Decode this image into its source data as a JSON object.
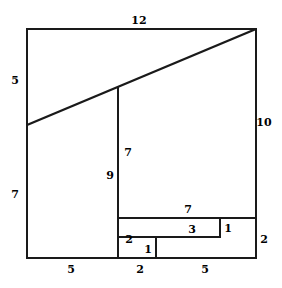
{
  "figure": {
    "stroke_color": "#1a1a1a",
    "background_color": "#ffffff",
    "outer_square": {
      "top_length": "12",
      "right_length": "10",
      "left_upper_length": "5",
      "left_lower_length": "7"
    },
    "labels": [
      {
        "id": "top-12",
        "text": "12",
        "x": 139,
        "y": 20
      },
      {
        "id": "left-5",
        "text": "5",
        "x": 15,
        "y": 80
      },
      {
        "id": "left-7",
        "text": "7",
        "x": 15,
        "y": 194
      },
      {
        "id": "right-10",
        "text": "10",
        "x": 264,
        "y": 122
      },
      {
        "id": "right-2",
        "text": "2",
        "x": 264,
        "y": 239
      },
      {
        "id": "inner-7",
        "text": "7",
        "x": 128,
        "y": 152
      },
      {
        "id": "inner-9",
        "text": "9",
        "x": 110,
        "y": 175
      },
      {
        "id": "band-7",
        "text": "7",
        "x": 188,
        "y": 209
      },
      {
        "id": "band-3",
        "text": "3",
        "x": 192,
        "y": 229
      },
      {
        "id": "band-1-right",
        "text": "1",
        "x": 228,
        "y": 228
      },
      {
        "id": "band-2-left",
        "text": "2",
        "x": 129,
        "y": 239
      },
      {
        "id": "band-1-bottom",
        "text": "1",
        "x": 148,
        "y": 249
      },
      {
        "id": "bottom-5-left",
        "text": "5",
        "x": 71,
        "y": 269
      },
      {
        "id": "bottom-2",
        "text": "2",
        "x": 140,
        "y": 269
      },
      {
        "id": "bottom-5-right",
        "text": "5",
        "x": 205,
        "y": 269
      }
    ],
    "geometry": {
      "outer_rect": {
        "x": 27,
        "y": 29,
        "w": 229,
        "h": 229
      },
      "diagonal": {
        "x1": 27,
        "y1": 125,
        "x2": 256,
        "y2": 29
      },
      "vertical_divider": {
        "x": 118,
        "y1": 86,
        "y2": 258
      },
      "band_top": {
        "y": 218,
        "x1": 118,
        "x2": 256
      },
      "step_path": "M 118 237 L 156 237 L 156 258",
      "step_path2": "M 156 237 L 220 237 L 220 218"
    }
  },
  "chart_data": {
    "type": "diagram",
    "edges": [
      {
        "name": "top",
        "value": 12
      },
      {
        "name": "right",
        "value": 10
      },
      {
        "name": "right-lower",
        "value": 2
      },
      {
        "name": "left-upper",
        "value": 5
      },
      {
        "name": "left-lower",
        "value": 7
      },
      {
        "name": "bottom-left",
        "value": 5
      },
      {
        "name": "bottom-middle",
        "value": 2
      },
      {
        "name": "bottom-right",
        "value": 5
      },
      {
        "name": "inner-vertical-upper",
        "value": 7
      },
      {
        "name": "inner-vertical-lower",
        "value": 9
      },
      {
        "name": "band-top",
        "value": 7
      },
      {
        "name": "step-horizontal",
        "value": 3
      },
      {
        "name": "step-right-riser",
        "value": 1
      },
      {
        "name": "step-left-riser",
        "value": 1
      },
      {
        "name": "band-left-riser",
        "value": 2
      }
    ]
  }
}
